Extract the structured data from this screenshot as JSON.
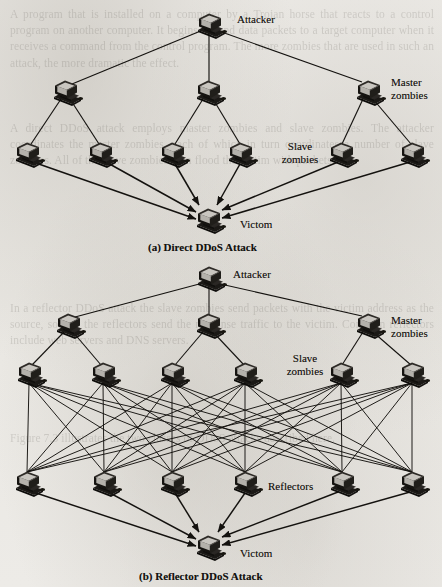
{
  "page": {
    "width": 442,
    "height": 587,
    "background_color": "#eceae6",
    "ink_color": "#141210"
  },
  "figures": [
    {
      "id": "direct-ddos",
      "caption": "(a) Direct DDoS Attack",
      "caption_x": 148,
      "caption_y": 241,
      "labels": [
        {
          "name": "attacker",
          "text": "Attacker",
          "x": 237,
          "y": 13,
          "align": "left"
        },
        {
          "name": "master-zombies",
          "text": "Master\nzombies",
          "x": 391,
          "y": 76,
          "align": "left"
        },
        {
          "name": "slave-zombies",
          "text": "Slave\nzombies",
          "x": 271,
          "y": 140,
          "align": "left"
        },
        {
          "name": "victim",
          "text": "Victom",
          "x": 240,
          "y": 218,
          "align": "left"
        }
      ],
      "nodes": {
        "attacker": [
          {
            "x": 209,
            "y": 23
          }
        ],
        "masters": [
          {
            "x": 65,
            "y": 90
          },
          {
            "x": 208,
            "y": 90
          },
          {
            "x": 368,
            "y": 90
          }
        ],
        "slaves": [
          {
            "x": 27,
            "y": 152
          },
          {
            "x": 100,
            "y": 152
          },
          {
            "x": 172,
            "y": 152
          },
          {
            "x": 240,
            "y": 152
          },
          {
            "x": 341,
            "y": 152
          },
          {
            "x": 412,
            "y": 152
          }
        ],
        "victim": [
          {
            "x": 208,
            "y": 218
          }
        ]
      },
      "edges_attacker_to_masters": [
        [
          0,
          0
        ],
        [
          0,
          1
        ],
        [
          0,
          2
        ]
      ],
      "edges_master_to_slaves": [
        [
          0,
          0
        ],
        [
          0,
          1
        ],
        [
          1,
          2
        ],
        [
          1,
          3
        ],
        [
          2,
          4
        ],
        [
          2,
          5
        ]
      ],
      "arrows_slaves_to_victim": [
        0,
        1,
        2,
        3,
        4,
        5
      ]
    },
    {
      "id": "reflector-ddos",
      "caption": "(b) Reflector DDoS Attack",
      "caption_x": 139,
      "caption_y": 570,
      "labels": [
        {
          "name": "attacker",
          "text": "Attacker",
          "x": 233,
          "y": 268,
          "align": "left"
        },
        {
          "name": "master-zombies",
          "text": "Master\nzombies",
          "x": 391,
          "y": 314,
          "align": "left"
        },
        {
          "name": "slave-zombies",
          "text": "Slave\nzombies",
          "x": 276,
          "y": 356,
          "align": "left"
        },
        {
          "name": "reflectors",
          "text": "Reflectors",
          "x": 268,
          "y": 480,
          "align": "left"
        },
        {
          "name": "victim",
          "text": "Victom",
          "x": 240,
          "y": 547,
          "align": "left"
        }
      ],
      "nodes": {
        "attacker": [
          {
            "x": 209,
            "y": 276
          }
        ],
        "masters": [
          {
            "x": 68,
            "y": 323
          },
          {
            "x": 208,
            "y": 323
          },
          {
            "x": 368,
            "y": 323
          }
        ],
        "slaves": [
          {
            "x": 29,
            "y": 372
          },
          {
            "x": 103,
            "y": 372
          },
          {
            "x": 172,
            "y": 372
          },
          {
            "x": 245,
            "y": 372
          },
          {
            "x": 341,
            "y": 372
          },
          {
            "x": 412,
            "y": 372
          }
        ],
        "reflectors": [
          {
            "x": 27,
            "y": 481
          },
          {
            "x": 104,
            "y": 481
          },
          {
            "x": 172,
            "y": 481
          },
          {
            "x": 245,
            "y": 481
          },
          {
            "x": 342,
            "y": 481
          },
          {
            "x": 412,
            "y": 481
          }
        ],
        "victim": [
          {
            "x": 208,
            "y": 545
          }
        ]
      },
      "edges_attacker_to_masters": [
        [
          0,
          0
        ],
        [
          0,
          1
        ],
        [
          0,
          2
        ]
      ],
      "edges_master_to_slaves": [
        [
          0,
          0
        ],
        [
          0,
          1
        ],
        [
          1,
          2
        ],
        [
          1,
          3
        ],
        [
          2,
          4
        ],
        [
          2,
          5
        ]
      ],
      "slave_reflector_mesh": "full-bipartite-6x6",
      "arrows_reflectors_to_victim": [
        0,
        1,
        2,
        3,
        4,
        5
      ]
    }
  ],
  "bleed_through_text": {
    "block1": "A program that is installed on a computer by a Trojan horse that reacts to a control program on another computer. It begins to send data packets to a target computer when it receives a command from the control program. The more zombies that are used in such an attack, the more dramatic the effect.",
    "block2": "A direct DDoS attack employs master zombies and slave zombies. The attacker coordinates the master zombies, each of which in turn coordinates a number of slave zombies. All of the slave zombies then flood the victim with packets.",
    "block3": "In a reflector DDoS attack the slave zombies send packets with the victim address as the source, so that the reflectors send the response traffic to the victim. Common reflectors include web servers and DNS servers.",
    "block4": "Figure 7.3 illustrates the two classes of DDoS attacks described here."
  }
}
